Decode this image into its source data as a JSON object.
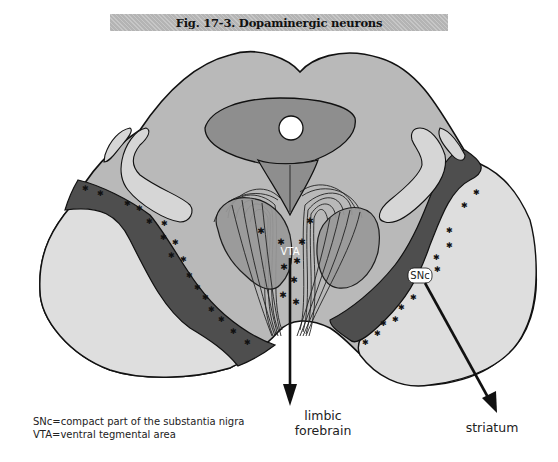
{
  "figure": {
    "title": "Fig. 17-3. Dopaminergic neurons"
  },
  "labels": {
    "vta": "VTA",
    "snc": "SNc",
    "limbic_line1": "limbic",
    "limbic_line2": "forebrain",
    "striatum": "striatum"
  },
  "legend": {
    "items": [
      "SNc=compact part of the substantia nigra",
      "VTA=ventral tegmental area"
    ]
  },
  "colors": {
    "title_bar": "#b4b4b4",
    "tegmentum": "#b9b9b9",
    "periaqueductal": "#8e8e8e",
    "substantia_nigra": "#4e4e4e",
    "cerebral_peduncle": "#dedede",
    "lemniscus": "#d6d6d6",
    "red_nucleus": "#999999",
    "outline": "#111111"
  }
}
